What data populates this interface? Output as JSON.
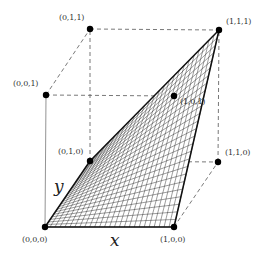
{
  "diagram": {
    "type": "unit-cube-bilinear-surface",
    "axes": {
      "x_label": "x",
      "y_label": "y"
    },
    "vertices": [
      {
        "id": "v000",
        "label": "(0,0,0)",
        "px": [
          45,
          227
        ]
      },
      {
        "id": "v100",
        "label": "(1,0,0)",
        "px": [
          174,
          227
        ]
      },
      {
        "id": "v010",
        "label": "(0,1,0)",
        "px": [
          90,
          161
        ]
      },
      {
        "id": "v110",
        "label": "(1,1,0)",
        "px": [
          218,
          162
        ]
      },
      {
        "id": "v001",
        "label": "(0,0,1)",
        "px": [
          46,
          95
        ]
      },
      {
        "id": "v011",
        "label": "(0,1,1)",
        "px": [
          90,
          29
        ]
      },
      {
        "id": "v111",
        "label": "(1,1,1)",
        "px": [
          219,
          30
        ]
      },
      {
        "id": "v101",
        "label": "(1,0,1)",
        "px": [
          174,
          96
        ]
      }
    ],
    "surface": {
      "description": "Bilinear surface z = xy spanning corners (0,0,0), (1,0,0), (1,1,1), (0,1,0)",
      "mesh_lines": 26,
      "color": "#111111"
    },
    "colors": {
      "edge": "#111111",
      "dashed": "#555555",
      "solid_cube": "#777777"
    }
  }
}
